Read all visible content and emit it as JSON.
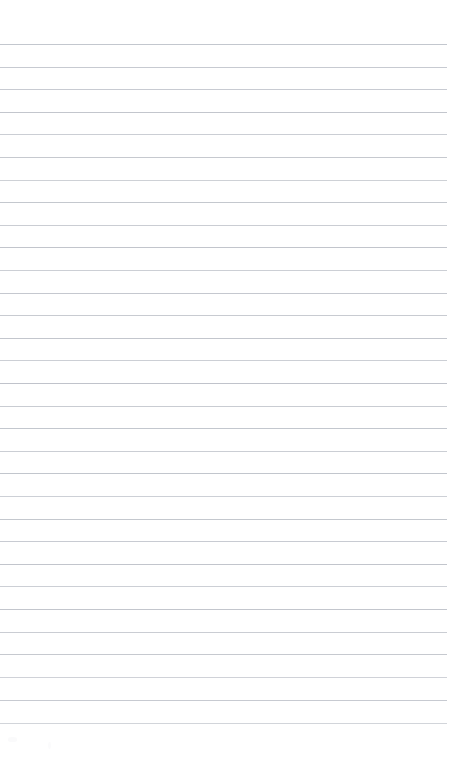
{
  "document": {
    "kind": "scanned-ruled-paper",
    "title": "Blank ruled notepad page",
    "page_width": 452,
    "page_height": 781,
    "background_color": "#ffffff",
    "written_text": "",
    "has_handwriting": false,
    "has_printed_text": false,
    "has_margin_rule": false,
    "has_holes": false
  },
  "ruling": {
    "line_color": "#b9bdc5",
    "line_thickness_px": 1,
    "line_count": 31,
    "first_line_y": 44,
    "line_spacing_px": 22.6,
    "line_left_x": 0,
    "line_right_x": 447,
    "top_margin_px": 44,
    "bottom_margin_px": 58,
    "lines": [
      {
        "index": 1,
        "y": 44,
        "left": 0,
        "right": 447,
        "opacity": 0.85
      },
      {
        "index": 2,
        "y": 67,
        "left": 0,
        "right": 447,
        "opacity": 0.8
      },
      {
        "index": 3,
        "y": 89,
        "left": 0,
        "right": 447,
        "opacity": 0.78
      },
      {
        "index": 4,
        "y": 112,
        "left": 0,
        "right": 447,
        "opacity": 0.86
      },
      {
        "index": 5,
        "y": 134,
        "left": 0,
        "right": 447,
        "opacity": 0.74
      },
      {
        "index": 6,
        "y": 157,
        "left": 0,
        "right": 447,
        "opacity": 0.82
      },
      {
        "index": 7,
        "y": 180,
        "left": 0,
        "right": 447,
        "opacity": 0.7
      },
      {
        "index": 8,
        "y": 202,
        "left": 0,
        "right": 447,
        "opacity": 0.84
      },
      {
        "index": 9,
        "y": 225,
        "left": 0,
        "right": 447,
        "opacity": 0.76
      },
      {
        "index": 10,
        "y": 247,
        "left": 0,
        "right": 447,
        "opacity": 0.88
      },
      {
        "index": 11,
        "y": 270,
        "left": 0,
        "right": 447,
        "opacity": 0.72
      },
      {
        "index": 12,
        "y": 293,
        "left": 0,
        "right": 447,
        "opacity": 0.83
      },
      {
        "index": 13,
        "y": 315,
        "left": 0,
        "right": 447,
        "opacity": 0.79
      },
      {
        "index": 14,
        "y": 338,
        "left": 0,
        "right": 447,
        "opacity": 0.86
      },
      {
        "index": 15,
        "y": 360,
        "left": 0,
        "right": 447,
        "opacity": 0.73
      },
      {
        "index": 16,
        "y": 383,
        "left": 0,
        "right": 447,
        "opacity": 0.9
      },
      {
        "index": 17,
        "y": 406,
        "left": 0,
        "right": 447,
        "opacity": 0.77
      },
      {
        "index": 18,
        "y": 428,
        "left": 0,
        "right": 447,
        "opacity": 0.85
      },
      {
        "index": 19,
        "y": 451,
        "left": 0,
        "right": 447,
        "opacity": 0.75
      },
      {
        "index": 20,
        "y": 473,
        "left": 0,
        "right": 447,
        "opacity": 0.87
      },
      {
        "index": 21,
        "y": 496,
        "left": 0,
        "right": 447,
        "opacity": 0.71
      },
      {
        "index": 22,
        "y": 519,
        "left": 0,
        "right": 447,
        "opacity": 0.84
      },
      {
        "index": 23,
        "y": 541,
        "left": 0,
        "right": 447,
        "opacity": 0.78
      },
      {
        "index": 24,
        "y": 564,
        "left": 0,
        "right": 447,
        "opacity": 0.88
      },
      {
        "index": 25,
        "y": 586,
        "left": 0,
        "right": 447,
        "opacity": 0.72
      },
      {
        "index": 26,
        "y": 609,
        "left": 0,
        "right": 447,
        "opacity": 0.86
      },
      {
        "index": 27,
        "y": 632,
        "left": 0,
        "right": 447,
        "opacity": 0.76
      },
      {
        "index": 28,
        "y": 654,
        "left": 0,
        "right": 447,
        "opacity": 0.82
      },
      {
        "index": 29,
        "y": 677,
        "left": 0,
        "right": 447,
        "opacity": 0.68
      },
      {
        "index": 30,
        "y": 700,
        "left": 0,
        "right": 447,
        "opacity": 0.8
      },
      {
        "index": 31,
        "y": 723,
        "left": 0,
        "right": 447,
        "opacity": 0.64
      }
    ]
  },
  "artifacts": {
    "color": "#fafafb",
    "specks": [
      {
        "x": 8,
        "y": 737,
        "w": 9,
        "h": 5,
        "opacity": 0.9
      },
      {
        "x": 48,
        "y": 742,
        "w": 3,
        "h": 7,
        "opacity": 0.8
      }
    ]
  }
}
